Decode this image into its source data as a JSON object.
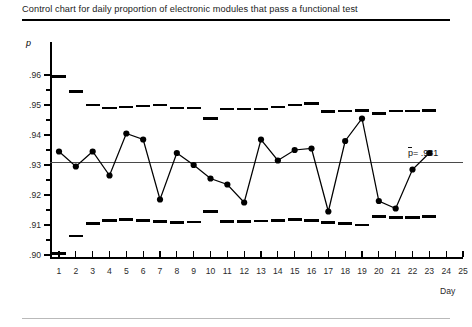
{
  "figure": {
    "title": "Control chart for daily proportion of electronic modules that pass a functional test",
    "y_axis_symbol": "p",
    "x_axis_label": "Day",
    "centerline_annotation": "= .931",
    "centerline_symbol": "p"
  },
  "chart_data": {
    "type": "line",
    "title": "Control chart for daily proportion of electronic modules that pass a functional test",
    "xlabel": "Day",
    "ylabel": "p",
    "ylim": [
      0.9,
      0.965
    ],
    "xlim": [
      0.4,
      25.6
    ],
    "grid": false,
    "legend": null,
    "yticks": [
      0.9,
      0.91,
      0.92,
      0.93,
      0.94,
      0.95,
      0.96
    ],
    "ytick_labels": [
      ".90",
      ".91",
      ".92",
      ".93",
      ".94",
      ".95",
      ".96"
    ],
    "yticks_minor": [
      0.905,
      0.915,
      0.925,
      0.935,
      0.945,
      0.955
    ],
    "xticks": [
      1,
      2,
      3,
      4,
      5,
      6,
      7,
      8,
      9,
      10,
      11,
      12,
      13,
      14,
      15,
      16,
      17,
      18,
      19,
      20,
      21,
      22,
      23,
      24,
      25
    ],
    "xtick_labels": [
      "1",
      "2",
      "3",
      "4",
      "5",
      "6",
      "7",
      "8",
      "9",
      "10",
      "11",
      "12",
      "13",
      "14",
      "15",
      "16",
      "17",
      "18",
      "19",
      "20",
      "21",
      "22",
      "23",
      "24",
      "25"
    ],
    "centerline": {
      "name": "p-bar",
      "value": 0.931,
      "label": "p̄ = .931",
      "style": "solid"
    },
    "series": [
      {
        "name": "daily proportion",
        "marker": "filled-circle",
        "x": [
          1,
          2,
          3,
          4,
          5,
          6,
          7,
          8,
          9,
          10,
          11,
          12,
          13,
          14,
          15,
          16,
          17,
          18,
          19,
          20,
          21,
          22,
          23
        ],
        "values": [
          0.9345,
          0.9295,
          0.9345,
          0.9265,
          0.9405,
          0.9385,
          0.9185,
          0.934,
          0.93,
          0.9255,
          0.9235,
          0.9175,
          0.9385,
          0.9315,
          0.935,
          0.9355,
          0.9145,
          0.938,
          0.9455,
          0.918,
          0.9155,
          0.9285,
          0.934
        ]
      }
    ],
    "control_limits": [
      {
        "name": "upper control limit",
        "style": "stepped-dashes",
        "x": [
          1,
          2,
          3,
          4,
          5,
          6,
          7,
          8,
          9,
          10,
          11,
          12,
          13,
          14,
          15,
          16,
          17,
          18,
          19,
          20,
          21,
          22,
          23
        ],
        "values": [
          0.9595,
          0.9545,
          0.95,
          0.949,
          0.9493,
          0.9497,
          0.95,
          0.949,
          0.949,
          0.9455,
          0.9487,
          0.9487,
          0.9487,
          0.9493,
          0.95,
          0.9505,
          0.9478,
          0.948,
          0.9482,
          0.9472,
          0.948,
          0.948,
          0.9482
        ]
      },
      {
        "name": "lower control limit",
        "style": "stepped-dashes",
        "x": [
          1,
          2,
          3,
          4,
          5,
          6,
          7,
          8,
          9,
          10,
          11,
          12,
          13,
          14,
          15,
          16,
          17,
          18,
          19,
          20,
          21,
          22,
          23
        ],
        "values": [
          0.9005,
          0.9063,
          0.9105,
          0.9115,
          0.9118,
          0.9115,
          0.9112,
          0.9108,
          0.911,
          0.9145,
          0.9112,
          0.9112,
          0.9113,
          0.9115,
          0.9118,
          0.9115,
          0.9108,
          0.9105,
          0.91,
          0.9128,
          0.9125,
          0.9125,
          0.9128
        ]
      }
    ]
  }
}
